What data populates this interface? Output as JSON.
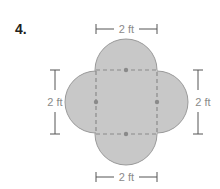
{
  "problem": {
    "number": "4."
  },
  "figure": {
    "shape": "square with four semicircles on each side",
    "fill_color": "#c8c8c8",
    "outline_color": "#9a9a9a",
    "dash_color": "#8a8a8a",
    "dimensions": {
      "top": "2 ft",
      "bottom": "2 ft",
      "left": "2 ft",
      "right": "2 ft"
    }
  }
}
